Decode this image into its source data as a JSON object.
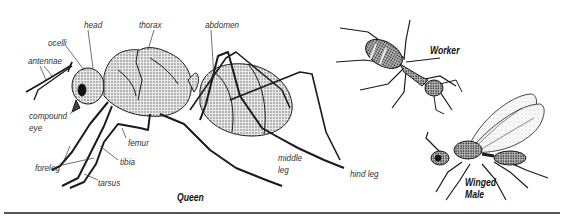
{
  "figure": {
    "specimens": [
      {
        "id": "queen",
        "caption": "Queen"
      },
      {
        "id": "worker",
        "caption": "Worker"
      },
      {
        "id": "winged_male",
        "caption_line1": "Winged",
        "caption_line2": "Male"
      }
    ],
    "labels": {
      "head": "head",
      "ocelli": "ocelli",
      "thorax": "thorax",
      "abdomen": "abdomen",
      "antennae": "antennae",
      "compound_eye_line1": "compound",
      "compound_eye_line2": "eye",
      "femur": "femur",
      "tibia": "tibia",
      "foreleg": "foreleg",
      "tarsus": "tarsus",
      "middle_leg_line1": "middle",
      "middle_leg_line2": "leg",
      "hind_leg": "hind leg"
    },
    "colors": {
      "ink": "#1a1a1a",
      "label": "#333333",
      "rule": "#555555",
      "background": "#ffffff"
    }
  }
}
